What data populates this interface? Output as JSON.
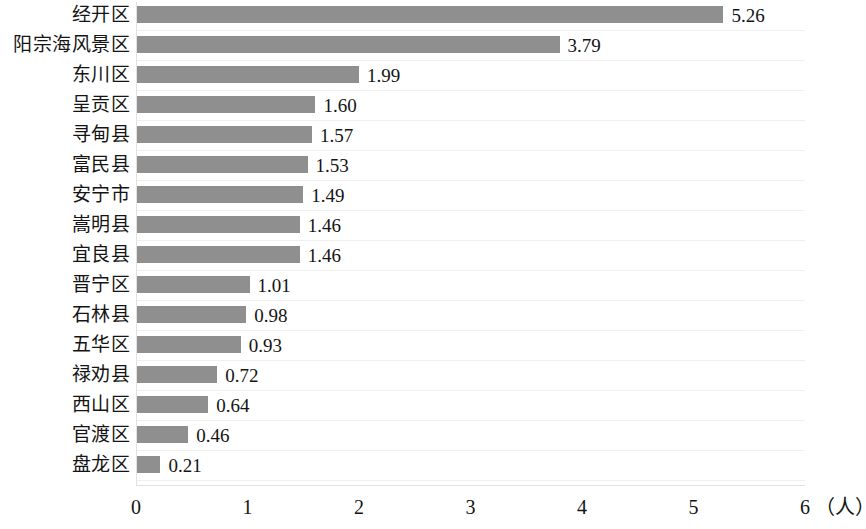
{
  "chart_data": {
    "type": "bar",
    "orientation": "horizontal",
    "title": "",
    "subtitle": "",
    "xlabel": "（人）",
    "ylabel": "",
    "xlim": [
      0,
      6
    ],
    "grid": true,
    "legend": null,
    "bar_color": "#8f8f8f",
    "xticks": [
      "0",
      "1",
      "2",
      "3",
      "4",
      "5",
      "6"
    ],
    "xtick_values": [
      0,
      1,
      2,
      3,
      4,
      5,
      6
    ],
    "categories": [
      "经开区",
      "阳宗海风景区",
      "东川区",
      "呈贡区",
      "寻甸县",
      "富民县",
      "安宁市",
      "嵩明县",
      "宜良县",
      "晋宁区",
      "石林县",
      "五华区",
      "禄劝县",
      "西山区",
      "官渡区",
      "盘龙区"
    ],
    "values": [
      5.26,
      3.79,
      1.99,
      1.6,
      1.57,
      1.53,
      1.49,
      1.46,
      1.46,
      1.01,
      0.98,
      0.93,
      0.72,
      0.64,
      0.46,
      0.21
    ],
    "value_labels": [
      "5.26",
      "3.79",
      "1.99",
      "1.60",
      "1.57",
      "1.53",
      "1.49",
      "1.46",
      "1.46",
      "1.01",
      "0.98",
      "0.93",
      "0.72",
      "0.64",
      "0.46",
      "0.21"
    ],
    "unit_suffix": "（人）"
  }
}
